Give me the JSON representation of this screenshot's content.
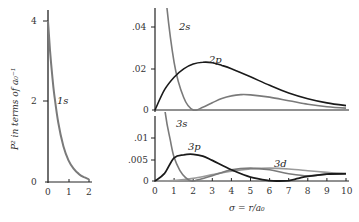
{
  "chart_data": [
    {
      "type": "line",
      "panel": "left",
      "title": "",
      "ylabel": "P² in terms of a₀⁻¹",
      "xlabel": "",
      "xlim": [
        0,
        2
      ],
      "ylim": [
        0,
        4
      ],
      "x_ticks": [
        "0",
        "1",
        "2"
      ],
      "y_ticks": [
        "0",
        "2",
        "4"
      ],
      "series": [
        {
          "name": "1s",
          "color": "#7a7a7a",
          "x": [
            0,
            0.1,
            0.2,
            0.3,
            0.5,
            0.75,
            1.0,
            1.25,
            1.5,
            1.75,
            2.0
          ],
          "values": [
            4.0,
            3.27,
            2.68,
            2.2,
            1.47,
            0.89,
            0.54,
            0.33,
            0.2,
            0.12,
            0.07
          ]
        }
      ]
    },
    {
      "type": "line",
      "panel": "top-right",
      "xlim": [
        0,
        10
      ],
      "ylim": [
        0,
        0.05
      ],
      "y_ticks": [
        "0",
        ".02",
        ".04"
      ],
      "series": [
        {
          "name": "2s",
          "color": "#7a7a7a",
          "x": [
            0,
            0.5,
            1,
            1.5,
            2,
            2.5,
            3,
            3.5,
            4,
            4.5,
            5,
            6,
            7,
            8,
            9,
            10
          ],
          "values": [
            0.125,
            0.061,
            0.023,
            0.006,
            0.0,
            0.0013,
            0.0035,
            0.0055,
            0.0068,
            0.0074,
            0.0073,
            0.0062,
            0.0045,
            0.0028,
            0.0016,
            0.0009
          ]
        },
        {
          "name": "2p",
          "color": "#1a1a1a",
          "x": [
            0,
            0.5,
            1,
            1.5,
            2,
            2.5,
            3,
            3.5,
            4,
            5,
            6,
            7,
            8,
            9,
            10
          ],
          "values": [
            0,
            0.0098,
            0.0158,
            0.0198,
            0.0221,
            0.023,
            0.0228,
            0.0215,
            0.0199,
            0.016,
            0.0119,
            0.0082,
            0.0054,
            0.0034,
            0.0021
          ]
        }
      ]
    },
    {
      "type": "line",
      "panel": "bottom-right",
      "xlabel": "σ = r/a₀",
      "xlim": [
        0,
        10
      ],
      "ylim": [
        0,
        0.015
      ],
      "x_ticks": [
        "0",
        "1",
        "2",
        "3",
        "4",
        "5",
        "6",
        "7",
        "8",
        "9",
        "10"
      ],
      "y_ticks": [
        "0",
        ".005",
        ".01"
      ],
      "series": [
        {
          "name": "3s",
          "color": "#7a7a7a",
          "x": [
            0,
            0.5,
            0.8,
            1,
            1.3,
            1.6,
            1.9,
            2.2,
            3,
            4,
            5,
            6,
            7,
            8,
            9,
            10
          ],
          "values": [
            0.037,
            0.017,
            0.0095,
            0.0055,
            0.0025,
            0.0008,
            0.0,
            0.0002,
            0.0012,
            0.0026,
            0.003,
            0.0026,
            0.0017,
            0.0012,
            0.0016,
            0.0017
          ]
        },
        {
          "name": "3p",
          "color": "#1a1a1a",
          "x": [
            0,
            0.5,
            1,
            1.5,
            2,
            2.5,
            3,
            4,
            5,
            6,
            6.5,
            7,
            7.5,
            8,
            9,
            10
          ],
          "values": [
            0,
            0.0018,
            0.0054,
            0.0061,
            0.0062,
            0.0058,
            0.0048,
            0.0026,
            0.0009,
            0.0001,
            0.0,
            0.0001,
            0.0006,
            0.0011,
            0.0016,
            0.0017
          ]
        },
        {
          "name": "3d",
          "color": "#9a9a9a",
          "x": [
            0,
            1,
            2,
            3,
            4,
            5,
            6,
            7,
            8,
            9,
            10
          ],
          "values": [
            0,
            0.0001,
            0.0006,
            0.0015,
            0.0023,
            0.0028,
            0.003,
            0.0028,
            0.0024,
            0.002,
            0.0016
          ]
        }
      ]
    }
  ],
  "labels": {
    "left_ylabel": "P² in terms of a₀⁻¹",
    "xlabel": "σ = r/a₀",
    "curve_1s": "1s",
    "curve_2s": "2s",
    "curve_2p": "2p",
    "curve_3s": "3s",
    "curve_3p": "3p",
    "curve_3d": "3d"
  },
  "ticks": {
    "left_y": [
      "0",
      "2",
      "4"
    ],
    "left_x": [
      "0",
      "1",
      "2"
    ],
    "top_y": [
      "0",
      ".02",
      ".04"
    ],
    "bottom_y": [
      "0",
      ".005",
      ".01"
    ],
    "bottom_x": [
      "0",
      "1",
      "2",
      "3",
      "4",
      "5",
      "6",
      "7",
      "8",
      "9",
      "10"
    ]
  }
}
